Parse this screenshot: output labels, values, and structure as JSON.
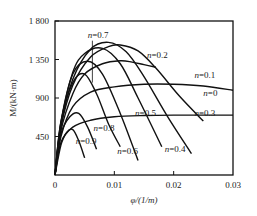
{
  "chart_data": {
    "type": "line",
    "title": "",
    "xlabel": "φ/(1/m)",
    "ylabel": "M/(kN·m)",
    "xlim": [
      0,
      0.03
    ],
    "ylim": [
      0,
      1800
    ],
    "x_ticks": [
      0,
      0.01,
      0.02,
      0.03
    ],
    "x_tick_labels": [
      "0",
      "0.01",
      "0.02",
      "0.03"
    ],
    "y_ticks": [
      450,
      900,
      1350,
      1800
    ],
    "y_tick_labels": [
      "450",
      "900",
      "1 350",
      "1 800"
    ],
    "grid": false,
    "legend": "inline labels",
    "series": [
      {
        "name": "n=0",
        "x": [
          0,
          0.001,
          0.003,
          0.006,
          0.01,
          0.015,
          0.02,
          0.025,
          0.03
        ],
        "y": [
          0,
          380,
          560,
          640,
          680,
          695,
          700,
          700,
          700
        ]
      },
      {
        "name": "n=0.1",
        "x": [
          0,
          0.001,
          0.003,
          0.006,
          0.01,
          0.015,
          0.02,
          0.025,
          0.03
        ],
        "y": [
          0,
          450,
          800,
          970,
          1030,
          1060,
          1060,
          1040,
          990
        ]
      },
      {
        "name": "n=0.2",
        "x": [
          0,
          0.001,
          0.003,
          0.005,
          0.008,
          0.011,
          0.013,
          0.015,
          0.017
        ],
        "y": [
          0,
          520,
          950,
          1180,
          1300,
          1335,
          1320,
          1290,
          1260
        ]
      },
      {
        "name": "n=0.3",
        "x": [
          0,
          0.001,
          0.003,
          0.006,
          0.009,
          0.011,
          0.014,
          0.017,
          0.021,
          0.025
        ],
        "y": [
          0,
          560,
          1050,
          1380,
          1500,
          1520,
          1450,
          1250,
          920,
          630
        ]
      },
      {
        "name": "n=0.4",
        "x": [
          0,
          0.001,
          0.003,
          0.006,
          0.009,
          0.012,
          0.015,
          0.019,
          0.023
        ],
        "y": [
          0,
          580,
          1120,
          1470,
          1550,
          1440,
          1150,
          680,
          250
        ]
      },
      {
        "name": "n=0.5",
        "x": [
          0,
          0.001,
          0.003,
          0.005,
          0.008,
          0.011,
          0.014,
          0.018
        ],
        "y": [
          0,
          600,
          1200,
          1420,
          1480,
          1300,
          900,
          330
        ]
      },
      {
        "name": "n=0.6",
        "x": [
          0,
          0.001,
          0.003,
          0.0055,
          0.008,
          0.011,
          0.014
        ],
        "y": [
          0,
          620,
          1180,
          1330,
          1180,
          720,
          170
        ]
      },
      {
        "name": "n=0.7",
        "x": [
          0,
          0.001,
          0.003,
          0.005,
          0.007,
          0.009,
          0.011
        ],
        "y": [
          0,
          620,
          1080,
          1180,
          950,
          600,
          330
        ]
      },
      {
        "name": "n=0.8",
        "x": [
          0,
          0.001,
          0.0025,
          0.004,
          0.0055,
          0.007
        ],
        "y": [
          0,
          480,
          680,
          720,
          560,
          300
        ]
      },
      {
        "name": "n=0.9",
        "x": [
          0,
          0.001,
          0.002,
          0.003,
          0.004,
          0.005
        ],
        "y": [
          0,
          350,
          500,
          530,
          400,
          200
        ]
      }
    ],
    "labels": [
      {
        "text": "n=0.7",
        "x": 0.0055,
        "y": 1600
      },
      {
        "text": "n=0.2",
        "x": 0.0155,
        "y": 1370
      },
      {
        "text": "n=0.1",
        "x": 0.0235,
        "y": 1130
      },
      {
        "text": "n=0",
        "x": 0.025,
        "y": 920
      },
      {
        "text": "n=0.3",
        "x": 0.0235,
        "y": 690
      },
      {
        "text": "n=0.5",
        "x": 0.0135,
        "y": 690
      },
      {
        "text": "n=0.8",
        "x": 0.0065,
        "y": 520
      },
      {
        "text": "n=0.9",
        "x": 0.0035,
        "y": 360
      },
      {
        "text": "n=0.6",
        "x": 0.0105,
        "y": 240
      },
      {
        "text": "n=0.4",
        "x": 0.0185,
        "y": 270
      }
    ]
  }
}
